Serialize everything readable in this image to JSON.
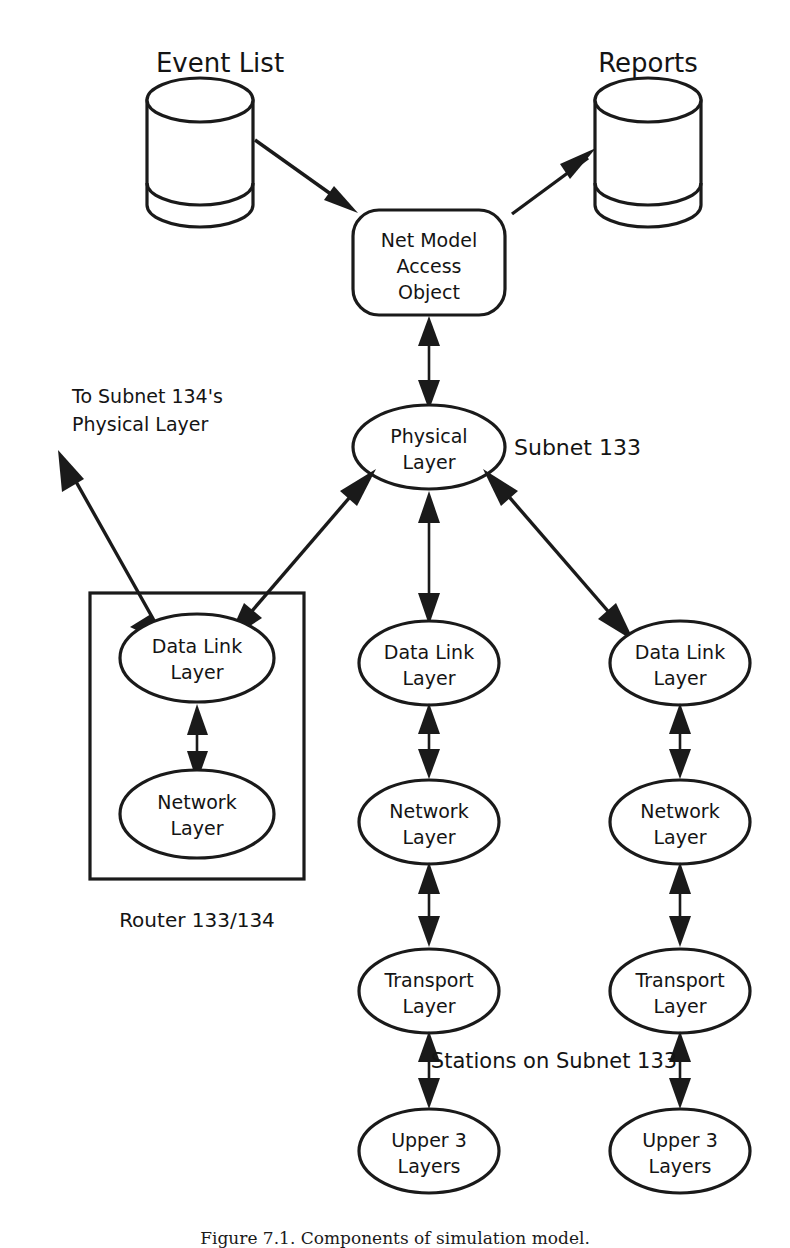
{
  "figure": {
    "caption": "Figure 7.1. Components of simulation model.",
    "caption_visible_fragment": "Figure 7.1. Components of simulation model.",
    "background_color": "#ffffff",
    "ink_color": "#1a1a1a",
    "width": 790,
    "height": 1248
  },
  "stores": [
    {
      "id": "event-list",
      "label": "Event List",
      "shape": "cylinder"
    },
    {
      "id": "reports",
      "label": "Reports",
      "shape": "cylinder"
    }
  ],
  "process_box": {
    "id": "net-model-access-object",
    "shape": "rounded-rectangle",
    "lines": [
      "Net Model",
      "Access",
      "Object"
    ]
  },
  "physical_layer": {
    "id": "physical-layer",
    "shape": "ellipse",
    "lines": [
      "Physical",
      "Layer"
    ]
  },
  "annotations": {
    "subnet_133": "Subnet 133",
    "to_subnet_134": [
      "To Subnet 134's",
      "Physical Layer"
    ],
    "router_caption": "Router 133/134",
    "stations_caption": "Stations on Subnet 133"
  },
  "router_group": {
    "id": "router-133-134",
    "shape": "rectangle",
    "label": "Router 133/134",
    "nodes": [
      {
        "id": "router-data-link-layer",
        "lines": [
          "Data Link",
          "Layer"
        ]
      },
      {
        "id": "router-network-layer",
        "lines": [
          "Network",
          "Layer"
        ]
      }
    ]
  },
  "station_columns": [
    {
      "id": "station-middle",
      "nodes": [
        {
          "id": "station-middle-data-link-layer",
          "lines": [
            "Data Link",
            "Layer"
          ]
        },
        {
          "id": "station-middle-network-layer",
          "lines": [
            "Network",
            "Layer"
          ]
        },
        {
          "id": "station-middle-transport-layer",
          "lines": [
            "Transport",
            "Layer"
          ]
        },
        {
          "id": "station-middle-upper-3-layers",
          "lines": [
            "Upper 3",
            "Layers"
          ]
        }
      ]
    },
    {
      "id": "station-right",
      "nodes": [
        {
          "id": "station-right-data-link-layer",
          "lines": [
            "Data Link",
            "Layer"
          ]
        },
        {
          "id": "station-right-network-layer",
          "lines": [
            "Network",
            "Layer"
          ]
        },
        {
          "id": "station-right-transport-layer",
          "lines": [
            "Transport",
            "Layer"
          ]
        },
        {
          "id": "station-right-upper-3-layers",
          "lines": [
            "Upper 3",
            "Layers"
          ]
        }
      ]
    }
  ],
  "connections": [
    {
      "id": "event-list-to-nmao",
      "from": "event-list",
      "to": "net-model-access-object",
      "direction": "one-way"
    },
    {
      "id": "nmao-to-reports",
      "from": "net-model-access-object",
      "to": "reports",
      "direction": "one-way"
    },
    {
      "id": "nmao-to-physical",
      "from": "net-model-access-object",
      "to": "physical-layer",
      "direction": "two-way"
    },
    {
      "id": "physical-to-router-dll",
      "from": "physical-layer",
      "to": "router-data-link-layer",
      "direction": "two-way"
    },
    {
      "id": "router-dll-to-subnet134",
      "from": "router-data-link-layer",
      "to": "to-subnet-134-physical-layer",
      "direction": "two-way"
    },
    {
      "id": "router-dll-to-router-nl",
      "from": "router-data-link-layer",
      "to": "router-network-layer",
      "direction": "two-way"
    },
    {
      "id": "physical-to-mid-dll",
      "from": "physical-layer",
      "to": "station-middle-data-link-layer",
      "direction": "two-way"
    },
    {
      "id": "mid-dll-to-mid-nl",
      "from": "station-middle-data-link-layer",
      "to": "station-middle-network-layer",
      "direction": "two-way"
    },
    {
      "id": "mid-nl-to-mid-tl",
      "from": "station-middle-network-layer",
      "to": "station-middle-transport-layer",
      "direction": "two-way"
    },
    {
      "id": "mid-tl-to-mid-u3",
      "from": "station-middle-transport-layer",
      "to": "station-middle-upper-3-layers",
      "direction": "two-way"
    },
    {
      "id": "physical-to-right-dll",
      "from": "physical-layer",
      "to": "station-right-data-link-layer",
      "direction": "two-way"
    },
    {
      "id": "right-dll-to-right-nl",
      "from": "station-right-data-link-layer",
      "to": "station-right-network-layer",
      "direction": "two-way"
    },
    {
      "id": "right-nl-to-right-tl",
      "from": "station-right-network-layer",
      "to": "station-right-transport-layer",
      "direction": "two-way"
    },
    {
      "id": "right-tl-to-right-u3",
      "from": "station-right-transport-layer",
      "to": "station-right-upper-3-layers",
      "direction": "two-way"
    }
  ]
}
